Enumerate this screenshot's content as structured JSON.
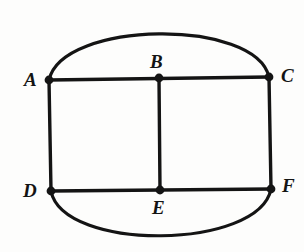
{
  "figure": {
    "background_color": "#fdfdfc",
    "stroke_color": "#141414",
    "label_color": "#141414",
    "stroke_width": 3.2,
    "vertex_dot_radius": 4.2,
    "vertices": [
      {
        "id": "A",
        "label": "A",
        "x": 49,
        "y": 80,
        "label_x": 24,
        "label_y": 70
      },
      {
        "id": "B",
        "label": "B",
        "x": 159,
        "y": 78,
        "label_x": 150,
        "label_y": 52
      },
      {
        "id": "C",
        "label": "C",
        "x": 269,
        "y": 77,
        "label_x": 281,
        "label_y": 66
      },
      {
        "id": "D",
        "label": "D",
        "x": 51,
        "y": 191,
        "label_x": 23,
        "label_y": 181
      },
      {
        "id": "E",
        "label": "E",
        "x": 160,
        "y": 190,
        "label_x": 152,
        "label_y": 198
      },
      {
        "id": "F",
        "label": "F",
        "x": 271,
        "y": 189,
        "label_x": 282,
        "label_y": 176
      }
    ],
    "segments": [
      {
        "name": "segment-AC",
        "from": "A",
        "to": "C"
      },
      {
        "name": "segment-DF",
        "from": "D",
        "to": "F"
      },
      {
        "name": "segment-AD",
        "from": "A",
        "to": "D"
      },
      {
        "name": "segment-CF",
        "from": "C",
        "to": "F"
      },
      {
        "name": "segment-BE",
        "from": "B",
        "to": "E"
      }
    ],
    "arcs": [
      {
        "name": "arc-top-A-C",
        "from": "A",
        "to": "C",
        "peak_y": 24
      },
      {
        "name": "arc-bottom-D-F",
        "from": "D",
        "to": "F",
        "peak_y": 244
      }
    ]
  }
}
